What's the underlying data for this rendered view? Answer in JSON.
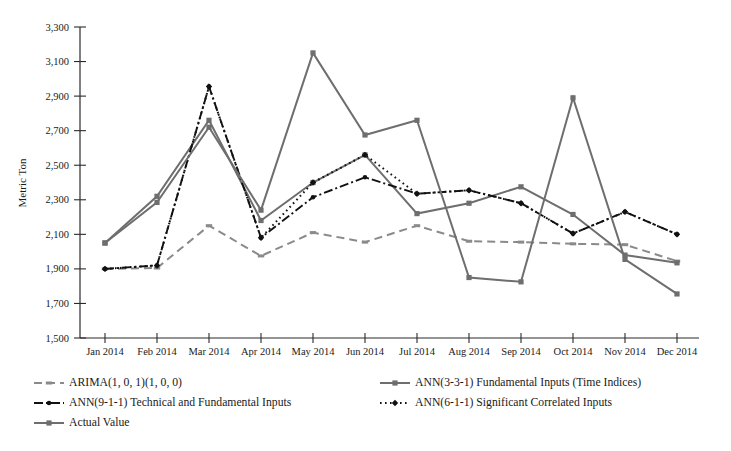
{
  "chart_data": {
    "type": "line",
    "title": "",
    "xlabel": "",
    "ylabel": "Metric Ton",
    "ylim": [
      1500,
      3300
    ],
    "yticks": [
      "1,500",
      "1,700",
      "1,900",
      "2,100",
      "2,300",
      "2,500",
      "2,700",
      "2,900",
      "3,100",
      "3,300"
    ],
    "ytick_values": [
      1500,
      1700,
      1900,
      2100,
      2300,
      2500,
      2700,
      2900,
      3100,
      3300
    ],
    "grid": false,
    "legend_position": "bottom",
    "categories": [
      "Jan 2014",
      "Feb 2014",
      "Mar 2014",
      "Apr 2014",
      "May 2014",
      "Jun 2014",
      "Jul 2014",
      "Aug 2014",
      "Sep 2014",
      "Oct 2014",
      "Nov 2014",
      "Dec 2014"
    ],
    "series": [
      {
        "name": "ARIMA(1, 0, 1)(1, 0, 0)",
        "style": "dashed",
        "color": "#8a8a8a",
        "marker": "dash",
        "values": [
          1900,
          1905,
          2150,
          1975,
          2110,
          2055,
          2150,
          2060,
          2055,
          2045,
          2040,
          1945
        ]
      },
      {
        "name": "ANN(3-3-1) Fundamental Inputs (Time Indices)",
        "style": "solid",
        "color": "#6e6e6e",
        "marker": "square",
        "values": [
          2050,
          2320,
          2760,
          2180,
          2400,
          2560,
          2220,
          2280,
          2375,
          2215,
          1980,
          1935
        ]
      },
      {
        "name": "ANN(9-1-1) Technical and Fundamental Inputs",
        "style": "dash-dot",
        "color": "#111111",
        "marker": "dot",
        "values": [
          1900,
          1920,
          2955,
          2080,
          2315,
          2430,
          2335,
          2355,
          2280,
          2105,
          2230,
          2100
        ]
      },
      {
        "name": "ANN(6-1-1) Significant Correlated Inputs",
        "style": "dotted",
        "color": "#111111",
        "marker": "diamond",
        "values": [
          1900,
          1920,
          2955,
          2080,
          2400,
          2560,
          2335,
          2355,
          2280,
          2105,
          2230,
          2100
        ]
      },
      {
        "name": "Actual Value",
        "style": "solid",
        "color": "#6e6e6e",
        "marker": "square",
        "values": [
          2050,
          2285,
          2720,
          2240,
          3150,
          2675,
          2760,
          1850,
          1825,
          2890,
          1955,
          1755
        ]
      }
    ]
  },
  "legend": {
    "items": [
      {
        "label": "ARIMA(1, 0, 1)(1, 0, 0)",
        "swatch": "dashed-gray-dot"
      },
      {
        "label": "ANN(3-3-1) Fundamental Inputs (Time Indices)",
        "swatch": "solid-gray-square"
      },
      {
        "label": "ANN(9-1-1) Technical and Fundamental Inputs",
        "swatch": "dash-dot-black"
      },
      {
        "label": "ANN(6-1-1) Significant Correlated Inputs",
        "swatch": "dotted-black-diamond"
      },
      {
        "label": "Actual Value",
        "swatch": "solid-gray-square"
      }
    ]
  }
}
